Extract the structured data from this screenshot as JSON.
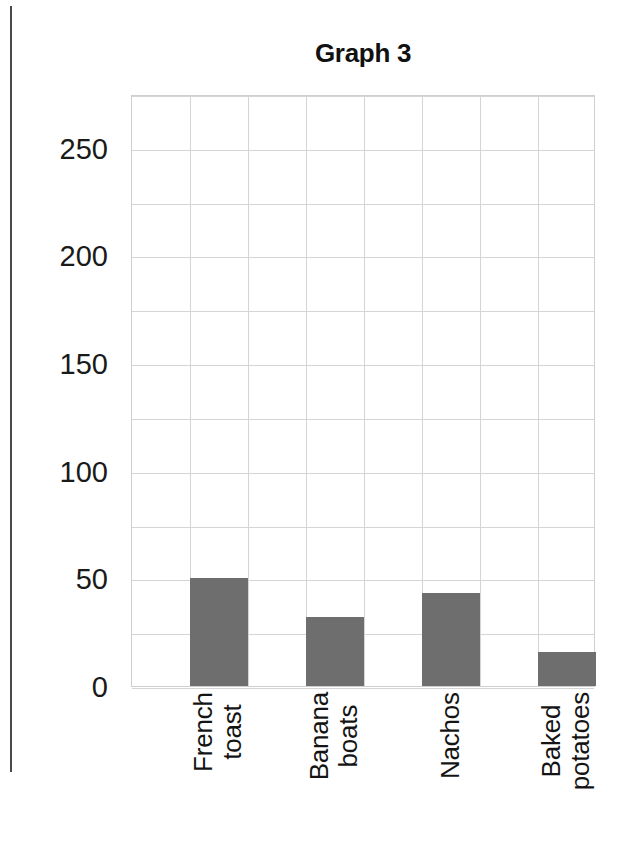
{
  "figure": {
    "title": "Graph 3"
  },
  "chart_data": {
    "type": "bar",
    "title": "Graph 3",
    "xlabel": "",
    "ylabel": "",
    "categories": [
      "French toast",
      "Banana boats",
      "Nachos",
      "Baked potatoes"
    ],
    "values": [
      50,
      32,
      43,
      16
    ],
    "ylim": [
      0,
      275
    ],
    "yticks": [
      0,
      50,
      100,
      150,
      200,
      250
    ],
    "ytick_labels": [
      "0",
      "50",
      "100",
      "150",
      "200",
      "250"
    ],
    "minor_ytick_step": 25,
    "grid": true,
    "legend": "none",
    "bar_color": "#6e6e6e",
    "gridline_color": "#d5d5d5",
    "plot_border_color": "#cfcfcf",
    "vertical_grid_columns": 8
  },
  "y_axis": {
    "ticks": [
      {
        "label": "250",
        "value": 250
      },
      {
        "label": "200",
        "value": 200
      },
      {
        "label": "150",
        "value": 150
      },
      {
        "label": "100",
        "value": 100
      },
      {
        "label": "50",
        "value": 50
      },
      {
        "label": "0",
        "value": 0
      }
    ]
  },
  "x_axis": {
    "categories": [
      {
        "lines": [
          "French",
          "toast"
        ],
        "value": 50
      },
      {
        "lines": [
          "Banana",
          "boats"
        ],
        "value": 32
      },
      {
        "lines": [
          "Nachos"
        ],
        "value": 43
      },
      {
        "lines": [
          "Baked",
          "potatoes"
        ],
        "value": 16
      }
    ]
  }
}
